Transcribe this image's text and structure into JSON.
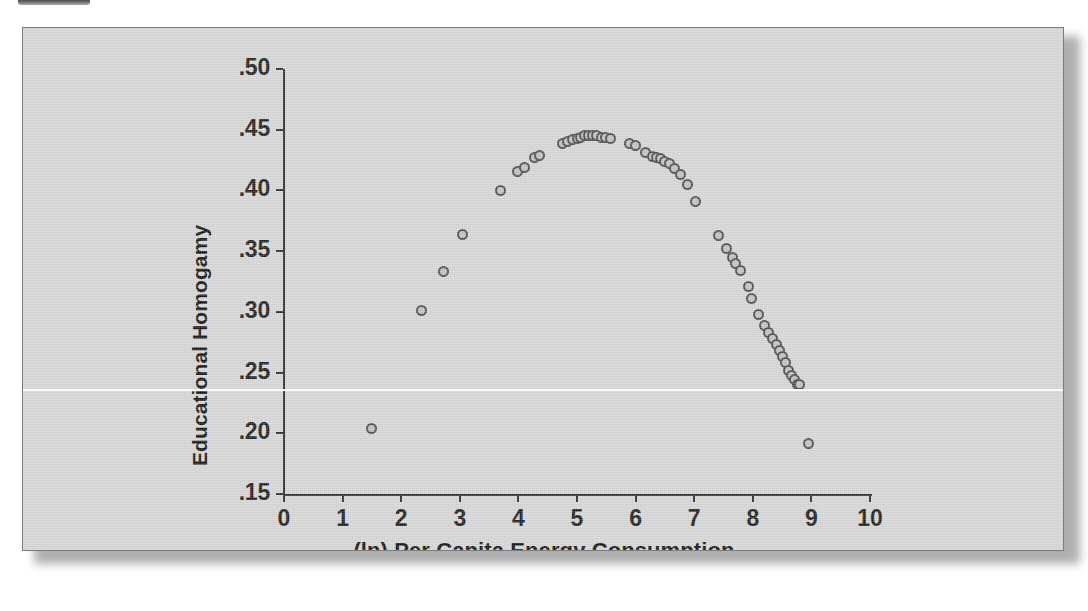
{
  "figure": {
    "panel_background": "#d4d4d4",
    "border_color": "#7c7c7c",
    "marker_edge_color": "#4d4d4d",
    "marker_fill_color": "#c0c0c0",
    "axis_color": "#2a2a2a"
  },
  "chart_data": {
    "type": "scatter",
    "title": "",
    "xlabel": "(ln) Per Capita Energy Consumption",
    "ylabel": "Educational Homogamy",
    "xlim": [
      0,
      10
    ],
    "ylim": [
      0.15,
      0.5
    ],
    "xticks": [
      "0",
      "1",
      "2",
      "3",
      "4",
      "5",
      "6",
      "7",
      "8",
      "9",
      "10"
    ],
    "xtick_values": [
      0,
      1,
      2,
      3,
      4,
      5,
      6,
      7,
      8,
      9,
      10
    ],
    "yticks": [
      ".50",
      ".45",
      ".40",
      ".35",
      ".30",
      ".25",
      ".20",
      ".15"
    ],
    "ytick_values": [
      0.5,
      0.45,
      0.4,
      0.35,
      0.3,
      0.25,
      0.2,
      0.15
    ],
    "grid": false,
    "legend": null,
    "marker": "open-circle",
    "n_points": 54,
    "x": [
      1.49,
      2.35,
      2.72,
      3.05,
      3.69,
      3.98,
      4.1,
      4.27,
      4.36,
      4.75,
      4.84,
      4.93,
      5.0,
      5.06,
      5.13,
      5.2,
      5.27,
      5.34,
      5.41,
      5.49,
      5.58,
      5.9,
      6.0,
      6.17,
      6.29,
      6.36,
      6.42,
      6.49,
      6.57,
      6.66,
      6.76,
      6.88,
      7.02,
      7.42,
      7.55,
      7.65,
      7.71,
      7.79,
      7.92,
      7.98,
      8.1,
      8.2,
      8.27,
      8.34,
      8.4,
      8.45,
      8.51,
      8.56,
      8.61,
      8.66,
      8.71,
      8.77,
      8.8,
      8.95
    ],
    "y": [
      0.204,
      0.301,
      0.333,
      0.364,
      0.4,
      0.416,
      0.419,
      0.427,
      0.429,
      0.439,
      0.44,
      0.442,
      0.443,
      0.444,
      0.445,
      0.445,
      0.445,
      0.445,
      0.444,
      0.444,
      0.443,
      0.439,
      0.437,
      0.431,
      0.428,
      0.427,
      0.426,
      0.424,
      0.422,
      0.418,
      0.413,
      0.405,
      0.391,
      0.363,
      0.352,
      0.345,
      0.34,
      0.334,
      0.321,
      0.311,
      0.298,
      0.289,
      0.283,
      0.278,
      0.273,
      0.268,
      0.263,
      0.258,
      0.252,
      0.248,
      0.244,
      0.24,
      0.24,
      0.192
    ]
  }
}
